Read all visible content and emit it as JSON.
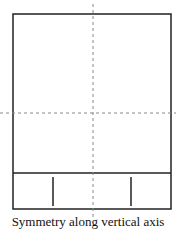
{
  "diagram": {
    "caption": "Symmetry along vertical axis",
    "colors": {
      "stroke": "#222222",
      "axis": "#888888",
      "background": "#ffffff"
    },
    "outer_rect": {
      "x": 13,
      "y": 14,
      "width": 158,
      "height": 195
    },
    "divider_y": 173,
    "inner_marks": [
      {
        "x": 53,
        "y1": 177,
        "y2": 206
      },
      {
        "x": 131,
        "y1": 177,
        "y2": 206
      }
    ],
    "axes": {
      "vertical": {
        "x": 93,
        "y1": 4,
        "y2": 218,
        "style": "dashed"
      },
      "horizontal": {
        "y": 113,
        "x1": 0,
        "x2": 176,
        "style": "dashed"
      }
    }
  }
}
